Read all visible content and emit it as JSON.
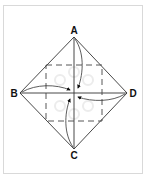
{
  "diagram": {
    "type": "origami-fold-diagram",
    "labels": {
      "top": "A",
      "left": "B",
      "bottom": "C",
      "right": "D"
    },
    "colors": {
      "line": "#333333",
      "dashed": "#444444",
      "frame": "#d9d9d9",
      "arrow": "#111111",
      "watermark": "#e6e6e6"
    }
  }
}
